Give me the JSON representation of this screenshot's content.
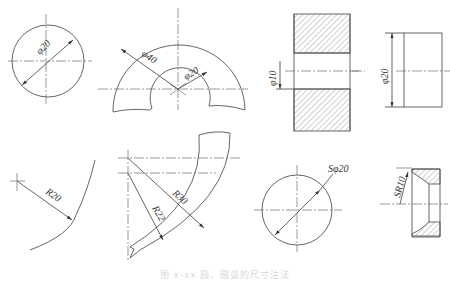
{
  "figure": {
    "caption": "图 x-xx 圆、圆弧的尺寸注法",
    "stroke_color": "#555555",
    "hatch_color": "#777777"
  },
  "views": [
    {
      "id": "circle-diameter",
      "label": "φ20"
    },
    {
      "id": "arc-diameters",
      "labels": [
        "φ40",
        "φ20"
      ]
    },
    {
      "id": "hole-section",
      "label": "φ10"
    },
    {
      "id": "cylinder-side",
      "label": "φ20"
    },
    {
      "id": "arc-radius",
      "label": "R20"
    },
    {
      "id": "concentric-arcs",
      "labels": [
        "R30",
        "R22"
      ]
    },
    {
      "id": "sphere-diameter",
      "label": "Sφ20"
    },
    {
      "id": "sphere-radius-section",
      "label": "SR10"
    }
  ]
}
